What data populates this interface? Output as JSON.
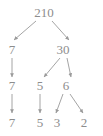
{
  "diagram": {
    "type": "factor-tree",
    "background_color": "#ffffff",
    "stroke_color": "#9a9a9a",
    "text_color": "#8d8d8d",
    "width": 103,
    "height": 136,
    "nodes": [
      {
        "id": "n210",
        "label": "210",
        "x": 44,
        "y": 12,
        "row": 1
      },
      {
        "id": "r2a",
        "label": "7",
        "x": 12,
        "y": 49,
        "row": 2
      },
      {
        "id": "r2b",
        "label": "30",
        "x": 63,
        "y": 49,
        "row": 2
      },
      {
        "id": "r3a",
        "label": "7",
        "x": 12,
        "y": 85,
        "row": 3
      },
      {
        "id": "r3b",
        "label": "5",
        "x": 40,
        "y": 85,
        "row": 3
      },
      {
        "id": "r3c",
        "label": "6",
        "x": 66,
        "y": 85,
        "row": 3
      },
      {
        "id": "r4a",
        "label": "7",
        "x": 12,
        "y": 122,
        "row": 4
      },
      {
        "id": "r4b",
        "label": "5",
        "x": 40,
        "y": 122,
        "row": 4
      },
      {
        "id": "r4c",
        "label": "3",
        "x": 57,
        "y": 122,
        "row": 4
      },
      {
        "id": "r4d",
        "label": "2",
        "x": 84,
        "y": 122,
        "row": 4
      }
    ],
    "edges": [
      {
        "id": "e1",
        "from": "n210",
        "to": "r2a",
        "x1": 36,
        "y1": 21,
        "x2": 14,
        "y2": 40
      },
      {
        "id": "e2",
        "from": "n210",
        "to": "r2b",
        "x1": 52,
        "y1": 21,
        "x2": 69,
        "y2": 40
      },
      {
        "id": "e3",
        "from": "r2a",
        "to": "r3a",
        "x1": 12,
        "y1": 58,
        "x2": 12,
        "y2": 77
      },
      {
        "id": "e4",
        "from": "r2b",
        "to": "r3b",
        "x1": 60,
        "y1": 58,
        "x2": 44,
        "y2": 77
      },
      {
        "id": "e5",
        "from": "r2b",
        "to": "r3c",
        "x1": 67,
        "y1": 58,
        "x2": 71,
        "y2": 77
      },
      {
        "id": "e6",
        "from": "r3a",
        "to": "r4a",
        "x1": 12,
        "y1": 94,
        "x2": 12,
        "y2": 113
      },
      {
        "id": "e7",
        "from": "r3b",
        "to": "r4b",
        "x1": 40,
        "y1": 94,
        "x2": 40,
        "y2": 113
      },
      {
        "id": "e8",
        "from": "r3c",
        "to": "r4c",
        "x1": 63,
        "y1": 94,
        "x2": 56,
        "y2": 113
      },
      {
        "id": "e9",
        "from": "r3c",
        "to": "r4d",
        "x1": 70,
        "y1": 94,
        "x2": 83,
        "y2": 113
      }
    ]
  },
  "chart_data": {
    "type": "diagram",
    "subtype": "factor-tree",
    "root": 210,
    "levels": [
      [
        "210"
      ],
      [
        "7",
        "30"
      ],
      [
        "7",
        "5",
        "6"
      ],
      [
        "7",
        "5",
        "3",
        "2"
      ]
    ],
    "prime_factors": [
      "7",
      "5",
      "3",
      "2"
    ]
  }
}
